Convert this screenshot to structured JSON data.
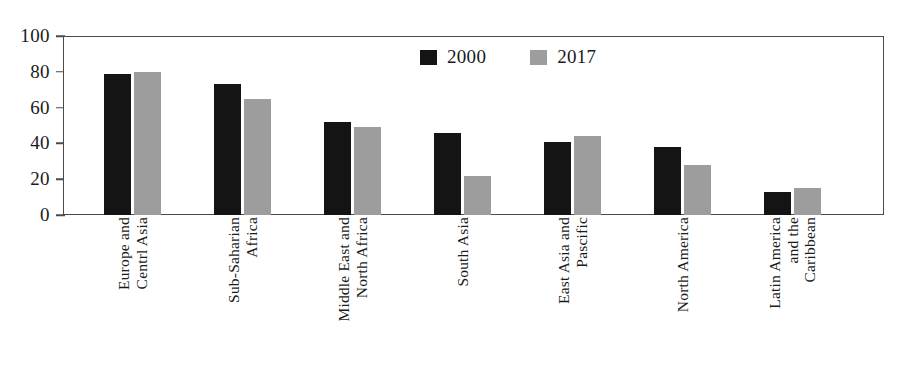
{
  "chart_data": {
    "type": "bar",
    "title": "",
    "xlabel": "",
    "ylabel": "",
    "ylim": [
      0,
      100
    ],
    "yticks": [
      0,
      20,
      40,
      60,
      80,
      100
    ],
    "grid": false,
    "legend_position": "top-center",
    "categories": [
      "Europe and Centrl Asia",
      "Sub-Saharian Africa",
      "Middle East and North Africa",
      "South Asia",
      "East Asia and Pascific",
      "North America",
      "Latin America and the Caribbean"
    ],
    "category_lines": [
      [
        "Europe and",
        "Centrl Asia"
      ],
      [
        "Sub-Saharian",
        "Africa"
      ],
      [
        "Middle East and",
        "North Africa"
      ],
      [
        "South Asia"
      ],
      [
        "East Asia and",
        "Pascific"
      ],
      [
        "North America"
      ],
      [
        "Latin America",
        "and the",
        "Caribbean"
      ]
    ],
    "series": [
      {
        "name": "2000",
        "color": "#141414",
        "values": [
          79,
          73,
          52,
          46,
          41,
          38,
          13
        ]
      },
      {
        "name": "2017",
        "color": "#9d9d9d",
        "values": [
          80,
          65,
          49,
          22,
          44,
          28,
          15
        ]
      }
    ]
  },
  "legend": {
    "items": [
      {
        "label": "2000",
        "color": "#141414"
      },
      {
        "label": "2017",
        "color": "#9d9d9d"
      }
    ]
  },
  "axes": {
    "y_tick_labels": [
      "100",
      "80",
      "60",
      "40",
      "20",
      "0"
    ],
    "axis_color": "#4a4a4a"
  }
}
